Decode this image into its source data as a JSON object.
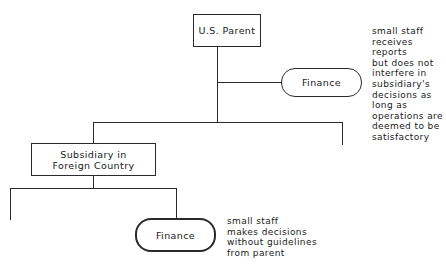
{
  "diagram": {
    "type": "organization-chart",
    "nodes": {
      "parent": {
        "label": "U.S. Parent",
        "shape": "rectangle"
      },
      "parent_finance": {
        "label": "Finance",
        "shape": "rounded-terminal"
      },
      "subsidiary": {
        "label_line1": "Subsidiary in",
        "label_line2": "Foreign Country",
        "shape": "rectangle"
      },
      "subsidiary_finance": {
        "label": "Finance",
        "shape": "rounded-terminal-bold"
      }
    },
    "annotations": {
      "parent_finance_note": "small staff\nreceives\nreports\nbut does not\ninterfere in\nsubsidiary's\ndecisions as\nlong as\noperations are\ndeemed to be\nsatisfactory",
      "subsidiary_finance_note": "small staff\nmakes decisions\nwithout guidelines\nfrom parent"
    },
    "edges": [
      {
        "from": "U.S. Parent",
        "to": "Finance (parent)"
      },
      {
        "from": "U.S. Parent",
        "to": "Subsidiary in Foreign Country"
      },
      {
        "from": "U.S. Parent",
        "to": "unlabeled branch (right)"
      },
      {
        "from": "Subsidiary in Foreign Country",
        "to": "unlabeled branch (left)"
      },
      {
        "from": "Subsidiary in Foreign Country",
        "to": "Finance (subsidiary)"
      }
    ],
    "colors": {
      "line": "#2a2a2a",
      "background": "#ffffff"
    }
  }
}
